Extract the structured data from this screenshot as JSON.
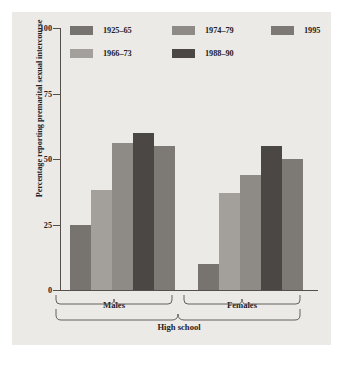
{
  "chart_data": {
    "type": "bar",
    "title": "",
    "subtitle": "",
    "xlabel": "High school",
    "ylabel": "Percentage reporting premarital sexual intercourse",
    "ylim": [
      0,
      100
    ],
    "yticks": [
      0,
      25,
      50,
      75,
      100
    ],
    "ytick_labels": [
      "0",
      "25",
      "50",
      "75",
      "100"
    ],
    "grid": false,
    "legend_position": "top-inside",
    "categories": [
      "Males",
      "Females"
    ],
    "group_label": "High school",
    "series": [
      {
        "name": "1925–65",
        "color": "#77736f",
        "values": [
          25,
          10
        ]
      },
      {
        "name": "1966–73",
        "color": "#a3a09b",
        "values": [
          38,
          37
        ]
      },
      {
        "name": "1974–79",
        "color": "#8e8b86",
        "values": [
          56,
          44
        ]
      },
      {
        "name": "1988–90",
        "color": "#4b4744",
        "values": [
          60,
          55
        ]
      },
      {
        "name": "1995",
        "color": "#7d7975",
        "values": [
          55,
          50
        ]
      }
    ]
  },
  "legend": {
    "entries": [
      {
        "label": "1925–65",
        "color": "#77736f"
      },
      {
        "label": "1966–73",
        "color": "#a3a09b"
      },
      {
        "label": "1974–79",
        "color": "#8e8b86"
      },
      {
        "label": "1988–90",
        "color": "#4b4744"
      },
      {
        "label": "1995",
        "color": "#7d7975"
      }
    ]
  },
  "axis": {
    "y_title": "Percentage reporting premarital sexual intercourse",
    "y_tick_labels": [
      "100",
      "75",
      "50",
      "25",
      "0"
    ],
    "x_group_labels": [
      "Males",
      "Females"
    ],
    "x_overall_label": "High school"
  },
  "colors": {
    "figure_background": "#eceae7",
    "page_background": "#ffffff",
    "axis": "#55504c",
    "text": "#25211e"
  }
}
